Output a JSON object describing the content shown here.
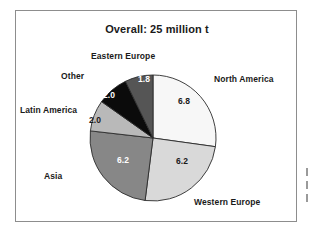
{
  "figure": {
    "title": "Overall: 25 million t",
    "unit": "million t"
  },
  "chart_data": {
    "type": "pie",
    "title": "Overall: 25 million t",
    "xlabel": "",
    "ylabel": "",
    "total": 25.0,
    "units": "million t",
    "legend_position": "none",
    "grid": false,
    "start_angle_deg": 0,
    "direction": "clockwise",
    "categories": [
      "North America",
      "Western Europe",
      "Asia",
      "Latin America",
      "Other",
      "Eastern Europe"
    ],
    "values": [
      6.8,
      6.2,
      6.2,
      2.0,
      2.0,
      1.8
    ],
    "value_labels": [
      "6.8",
      "6.2",
      "6.2",
      "2.0",
      "2.0",
      "1.8"
    ],
    "slices": [
      {
        "label": "North America",
        "value": 6.8,
        "value_label": "6.8",
        "percent": 27.2,
        "color": "#f7f7f7",
        "text_color": "#1a1a1a"
      },
      {
        "label": "Western Europe",
        "value": 6.2,
        "value_label": "6.2",
        "percent": 24.8,
        "color": "#d9d9d9",
        "text_color": "#1a1a1a"
      },
      {
        "label": "Asia",
        "value": 6.2,
        "value_label": "6.2",
        "percent": 24.8,
        "color": "#878787",
        "text_color": "#ffffff"
      },
      {
        "label": "Latin America",
        "value": 2.0,
        "value_label": "2.0",
        "percent": 8.0,
        "color": "#b9b9b9",
        "text_color": "#1a1a1a"
      },
      {
        "label": "Other",
        "value": 2.0,
        "value_label": "2.0",
        "percent": 8.0,
        "color": "#0b0b0b",
        "text_color": "#ffffff"
      },
      {
        "label": "Eastern Europe",
        "value": 1.8,
        "value_label": "1.8",
        "percent": 7.2,
        "color": "#555555",
        "text_color": "#ffffff"
      }
    ]
  },
  "colors": {
    "frame_border": "#8d8d8d",
    "slice_outline": "#2b2b2b",
    "background": "#ffffff",
    "text": "#1a1a1a"
  }
}
